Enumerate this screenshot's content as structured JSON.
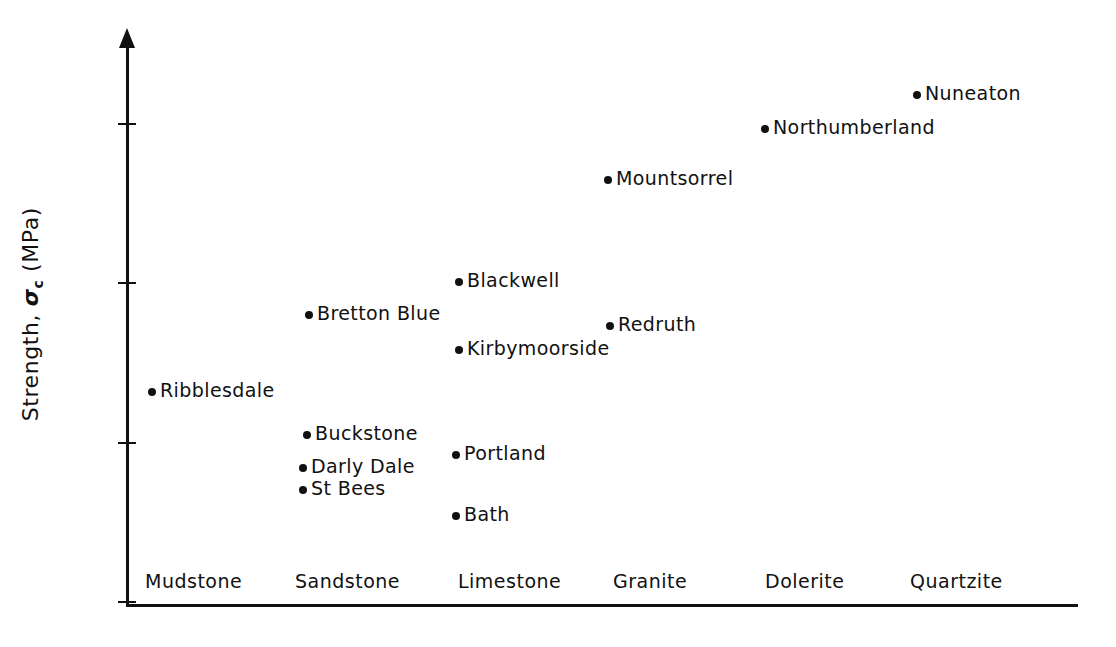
{
  "chart_data": {
    "type": "scatter",
    "title": "",
    "xlabel": "",
    "ylabel": "Strength, σc (MPa)",
    "ylabel_parts": {
      "prefix": "Strength, ",
      "symbol": "σ",
      "subscript": "c",
      "units": " (MPa)"
    },
    "categories": [
      "Mudstone",
      "Sandstone",
      "Limestone",
      "Granite",
      "Dolerite",
      "Quartzite"
    ],
    "ylim": [
      0,
      340
    ],
    "yticks": [
      0,
      100,
      200,
      300
    ],
    "ytick_labels": [
      "0",
      "100",
      "200",
      "300"
    ],
    "grid": false,
    "legend": "none",
    "points": [
      {
        "label": "Ribblesdale",
        "category": "Mudstone",
        "value": 132
      },
      {
        "label": "Bretton Blue",
        "category": "Sandstone",
        "value": 180
      },
      {
        "label": "Buckstone",
        "category": "Sandstone",
        "value": 105
      },
      {
        "label": "Darly Dale",
        "category": "Sandstone",
        "value": 84
      },
      {
        "label": "St Bees",
        "category": "Sandstone",
        "value": 70
      },
      {
        "label": "Blackwell",
        "category": "Limestone",
        "value": 201
      },
      {
        "label": "Kirbymoorside",
        "category": "Limestone",
        "value": 158
      },
      {
        "label": "Portland",
        "category": "Limestone",
        "value": 92
      },
      {
        "label": "Bath",
        "category": "Limestone",
        "value": 54
      },
      {
        "label": "Mountsorrel",
        "category": "Granite",
        "value": 265
      },
      {
        "label": "Redruth",
        "category": "Granite",
        "value": 173
      },
      {
        "label": "Northumberland",
        "category": "Dolerite",
        "value": 297
      },
      {
        "label": "Nuneaton",
        "category": "Quartzite",
        "value": 318
      }
    ]
  },
  "layout": {
    "point_x": {
      "Ribblesdale": 152,
      "Bretton Blue": 309,
      "Buckstone": 307,
      "Darly Dale": 303,
      "St Bees": 303,
      "Blackwell": 459,
      "Kirbymoorside": 459,
      "Portland": 456,
      "Bath": 456,
      "Mountsorrel": 608,
      "Redruth": 610,
      "Northumberland": 765,
      "Nuneaton": 917
    },
    "category_x": {
      "Mudstone": 145,
      "Sandstone": 295,
      "Limestone": 458,
      "Granite": 613,
      "Dolerite": 765,
      "Quartzite": 910
    }
  },
  "colors": {
    "ink": "#111111",
    "background": "#ffffff"
  }
}
